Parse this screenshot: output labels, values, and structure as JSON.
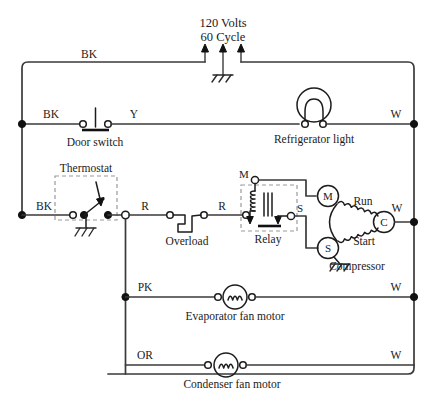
{
  "diagram": {
    "supply": {
      "voltage_label": "120 Volts",
      "frequency_label": "60 Cycle",
      "ground_icon": "ground-icon"
    },
    "wire_colors": {
      "black": "BK",
      "yellow": "Y",
      "white": "W",
      "red": "R",
      "pink": "PK",
      "orange": "OR"
    },
    "line_color": "#3a3a3a",
    "symbol_color": "#1c1c1c",
    "labels": {
      "bk_top": "BK",
      "bk_door": "BK",
      "y_door": "Y",
      "w_light": "W",
      "bk_thermostat": "BK",
      "r_left": "R",
      "r_right": "R",
      "w_compressor": "W",
      "pk_evap": "PK",
      "w_evap": "W",
      "or_cond": "OR",
      "w_cond": "W"
    },
    "components": [
      {
        "id": "door-switch",
        "name": "Door switch",
        "label": "Door switch",
        "type": "push-switch",
        "terminals": [
          "BK",
          "Y"
        ]
      },
      {
        "id": "refrigerator-light",
        "name": "Refrigerator light",
        "label": "Refrigerator light",
        "type": "lamp",
        "terminals": [
          "Y",
          "W"
        ]
      },
      {
        "id": "thermostat",
        "name": "Thermostat",
        "label": "Thermostat",
        "type": "temperature-switch",
        "enclosure": "dashed",
        "grounded": true,
        "terminals": [
          "BK",
          "R"
        ]
      },
      {
        "id": "overload",
        "name": "Overload",
        "label": "Overload",
        "type": "bimetal-overload",
        "terminals": [
          "R",
          "R"
        ]
      },
      {
        "id": "relay",
        "name": "Relay",
        "label": "Relay",
        "type": "current-relay",
        "enclosure": "dashed",
        "terminal_m": "M",
        "terminal_s": "S"
      },
      {
        "id": "compressor",
        "name": "Compressor",
        "label": "Compressor",
        "type": "motor-3-terminal",
        "grounded": true,
        "terminal_m": "M",
        "terminal_s": "S",
        "terminal_c": "C",
        "winding_run": "Run",
        "winding_start": "Start"
      },
      {
        "id": "evaporator-fan-motor",
        "name": "Evaporator fan motor",
        "label": "Evaporator fan motor",
        "type": "motor",
        "terminals": [
          "PK",
          "W"
        ]
      },
      {
        "id": "condenser-fan-motor",
        "name": "Condenser fan motor",
        "label": "Condenser fan motor",
        "type": "motor",
        "terminals": [
          "OR",
          "W"
        ]
      }
    ]
  }
}
